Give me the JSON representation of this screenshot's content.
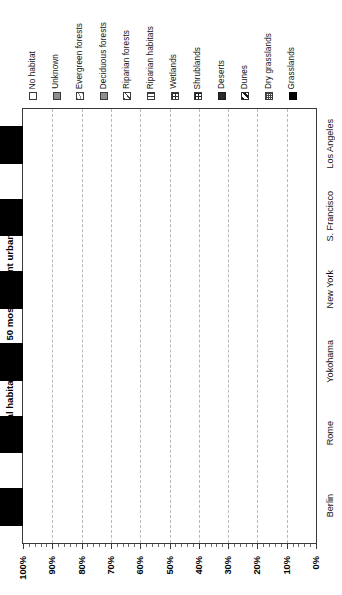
{
  "chart_data": {
    "type": "bar",
    "orientation": "horizontal-rotated",
    "title": "",
    "ylabel": "Natural habitats of the 50 most frequent urban plants",
    "xlabel": "",
    "stacked": true,
    "normalized": true,
    "xlim": [
      0,
      100
    ],
    "xtick_labels": [
      "100%",
      "90%",
      "80%",
      "70%",
      "60%",
      "50%",
      "40%",
      "30%",
      "20%",
      "10%",
      "0%"
    ],
    "xtick_values": [
      100,
      90,
      80,
      70,
      60,
      50,
      40,
      30,
      20,
      10,
      0
    ],
    "x_axis_direction": "descending-left-to-right",
    "grid": "vertical-dashed",
    "legend_position": "top",
    "categories": [
      "Berlin",
      "Rome",
      "Yokohama",
      "New York",
      "S. Francisco",
      "Los Angeles"
    ],
    "series": [
      {
        "name": "No habitat",
        "swatch": "p-none",
        "values": [
          16.0,
          37.0,
          52.0,
          56.0,
          36.0,
          30.0
        ]
      },
      {
        "name": "Unknown",
        "swatch": "p-unknown",
        "values": [
          0.0,
          0.0,
          0.0,
          0.0,
          0.0,
          0.0
        ]
      },
      {
        "name": "Evergreen forests",
        "swatch": "p-evergreen",
        "values": [
          0.0,
          1.5,
          1.5,
          3.0,
          0.0,
          0.0
        ]
      },
      {
        "name": "Deciduous forests",
        "swatch": "p-deciduous",
        "values": [
          17.0,
          0.0,
          0.0,
          0.0,
          7.0,
          0.0
        ]
      },
      {
        "name": "Riparian forests",
        "swatch": "p-ripfor",
        "values": [
          10.0,
          8.0,
          11.0,
          5.0,
          0.0,
          4.0
        ]
      },
      {
        "name": "Riparian habitats",
        "swatch": "p-riphab",
        "values": [
          0.0,
          0.0,
          5.0,
          9.0,
          0.0,
          0.0
        ]
      },
      {
        "name": "Wetlands",
        "swatch": "p-wetlands",
        "values": [
          13.0,
          9.0,
          4.0,
          0.0,
          6.0,
          23.0
        ]
      },
      {
        "name": "Shrublands",
        "swatch": "p-shrub",
        "values": [
          2.0,
          4.5,
          5.5,
          7.0,
          6.0,
          5.0
        ]
      },
      {
        "name": "Deserts",
        "swatch": "p-desert",
        "values": [
          1.5,
          1.5,
          1.5,
          0.0,
          1.0,
          3.0
        ]
      },
      {
        "name": "Dunes",
        "swatch": "p-dunes",
        "values": [
          1.5,
          2.5,
          1.0,
          4.0,
          3.0,
          2.0
        ]
      },
      {
        "name": "Dry grasslands",
        "swatch": "p-drygrass",
        "values": [
          2.0,
          11.0,
          0.5,
          5.0,
          0.0,
          4.0
        ]
      },
      {
        "name": "Grasslands",
        "swatch": "p-grass",
        "values": [
          37.0,
          25.0,
          18.0,
          11.0,
          41.0,
          29.0
        ]
      }
    ]
  },
  "legend": {
    "items": [
      {
        "label": "No habitat",
        "swatch": "p-none"
      },
      {
        "label": "Unknown",
        "swatch": "p-unknown"
      },
      {
        "label": "Evergreen forests",
        "swatch": "p-evergreen"
      },
      {
        "label": "Deciduous forests",
        "swatch": "p-deciduous"
      },
      {
        "label": "Riparian forests",
        "swatch": "p-ripfor"
      },
      {
        "label": "Riparian habitats",
        "swatch": "p-riphab"
      },
      {
        "label": "Wetlands",
        "swatch": "p-wetlands"
      },
      {
        "label": "Shrublands",
        "swatch": "p-shrub"
      },
      {
        "label": "Deserts",
        "swatch": "p-desert"
      },
      {
        "label": "Dunes",
        "swatch": "p-dunes"
      },
      {
        "label": "Dry grasslands",
        "swatch": "p-drygrass"
      },
      {
        "label": "Grasslands",
        "swatch": "p-grass"
      }
    ]
  }
}
